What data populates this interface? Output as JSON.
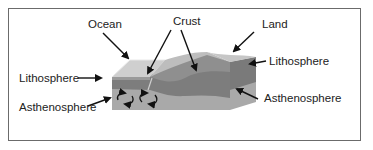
{
  "diagram": {
    "type": "labeled-cross-section",
    "labels": {
      "ocean": "Ocean",
      "crust": "Crust",
      "land": "Land",
      "lithosphere_left": "Lithosphere",
      "lithosphere_right": "Lithosphere",
      "asthenosphere_left": "Asthenosphere",
      "asthenosphere_right": "Asthenosphere"
    },
    "colors": {
      "frame": "#6b6b6b",
      "ocean_surface": "#c9c9c9",
      "land_surface": "#bdbdbd",
      "lithosphere": "#7d7d7d",
      "asthenosphere": "#a9a9a9",
      "arrow": "#111111"
    },
    "icons": [
      "convection-current-icon",
      "convection-current-icon"
    ]
  }
}
